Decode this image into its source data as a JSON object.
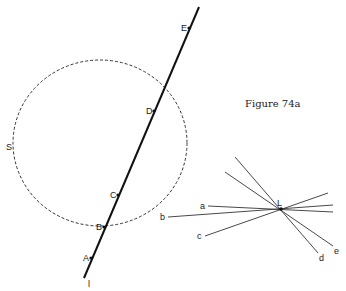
{
  "caption": "Figure 74a",
  "circle": {
    "label": "S",
    "cx": 100,
    "cy": 143,
    "rx": 87,
    "ry": 83
  },
  "line_l": {
    "label": "l",
    "from": [
      84,
      278
    ],
    "to": [
      199,
      7
    ],
    "points": [
      {
        "label": "A",
        "x": 91,
        "y": 258
      },
      {
        "label": "B",
        "x": 104,
        "y": 227
      },
      {
        "label": "C",
        "x": 118,
        "y": 195
      },
      {
        "label": "D",
        "x": 154,
        "y": 111
      },
      {
        "label": "E",
        "x": 189,
        "y": 28
      }
    ]
  },
  "pencil": {
    "center_label": "L",
    "center": [
      281,
      209
    ],
    "lines": [
      {
        "label": "a",
        "from": [
          208,
          206
        ],
        "to": [
          333,
          212
        ]
      },
      {
        "label": "b",
        "from": [
          168,
          217
        ],
        "to": [
          333,
          205
        ]
      },
      {
        "label": "c",
        "from": [
          205,
          236
        ],
        "to": [
          328,
          193
        ]
      },
      {
        "label": "d",
        "from": [
          235,
          157
        ],
        "to": [
          318,
          253
        ]
      },
      {
        "label": "e",
        "from": [
          225,
          172
        ],
        "to": [
          333,
          246
        ]
      }
    ]
  }
}
